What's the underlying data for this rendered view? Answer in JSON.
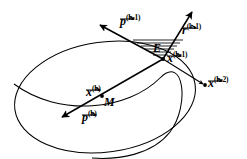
{
  "figure": {
    "background_color": "#ffffff",
    "stroke_color": "#000000",
    "width": 247,
    "height": 159
  },
  "labels": {
    "p_k_minus_1": {
      "base": "p",
      "superscript": "(k-1)",
      "vector": true
    },
    "r_k_minus_1": {
      "base": "r",
      "superscript": "(k-1)",
      "vector": true
    },
    "x_k_minus_1": {
      "base": "x",
      "superscript": "(k-1)",
      "vector": true
    },
    "x_k_minus_2": {
      "base": "x",
      "superscript": "(k-2)",
      "vector": true
    },
    "x_k": {
      "base": "x",
      "superscript": "(k)",
      "vector": true
    },
    "p_k": {
      "base": "p",
      "superscript": "(k)",
      "vector": true
    },
    "region_E": {
      "base": "E",
      "superscript": "",
      "vector": false
    },
    "point_M": {
      "base": "M",
      "superscript": "",
      "vector": false
    }
  },
  "shapes": {
    "ellipse": {
      "name": "ellipse-M",
      "cx": 105,
      "cy": 97,
      "rx": 91,
      "ry": 55,
      "rotation": -8
    },
    "arc": {
      "name": "intersecting-arc"
    },
    "hatch": {
      "name": "hatched-wedge-E",
      "line_count": 6
    },
    "points": [
      {
        "name": "point-M-dot",
        "x": 102,
        "y": 96
      },
      {
        "name": "point-x-km1-dot",
        "x": 163,
        "y": 59
      },
      {
        "name": "point-x-km2-dot",
        "x": 205,
        "y": 85
      }
    ],
    "arrows": [
      {
        "name": "arrow-p-k-minus-1",
        "direction": "up-left"
      },
      {
        "name": "arrow-r-k-minus-1",
        "direction": "up-right"
      },
      {
        "name": "arrow-p-k",
        "direction": "down-left"
      },
      {
        "name": "arrow-x-k-minus-2",
        "direction": "down-right"
      }
    ]
  }
}
